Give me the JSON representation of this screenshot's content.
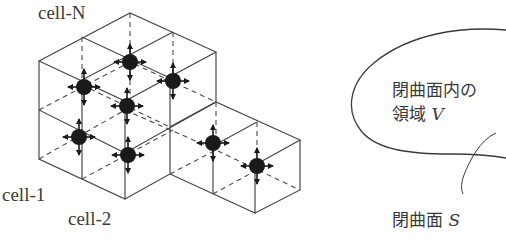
{
  "left_figure": {
    "labels": {
      "cell_n": "cell-N",
      "cell_1": "cell-1",
      "cell_2": "cell-2"
    },
    "particles": [
      {
        "name": "particle-1",
        "x": 79,
        "y": 137
      },
      {
        "name": "particle-2",
        "x": 84,
        "y": 87
      },
      {
        "name": "particle-3",
        "x": 130,
        "y": 62
      },
      {
        "name": "particle-4",
        "x": 127,
        "y": 106
      },
      {
        "name": "particle-5",
        "x": 173,
        "y": 81
      },
      {
        "name": "particle-6",
        "x": 128,
        "y": 155
      },
      {
        "name": "particle-7",
        "x": 213,
        "y": 143
      },
      {
        "name": "particle-8",
        "x": 257,
        "y": 166
      }
    ],
    "arrow_directions": [
      "up",
      "down",
      "left",
      "right"
    ],
    "colors": {
      "line": "#4a4a4a",
      "particle": "#1a1a1a"
    }
  },
  "right_figure": {
    "region_label_line1": "閉曲面内の",
    "region_label_line2_prefix": "領域 ",
    "region_label_var": "V",
    "surface_label_prefix": "閉曲面 ",
    "surface_label_var": "S"
  }
}
